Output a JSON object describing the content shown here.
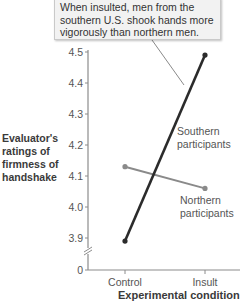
{
  "chart_data": {
    "type": "line",
    "title": "",
    "xlabel": "Experimental condition",
    "ylabel": [
      "Evaluator's",
      "ratings of",
      "firmness of",
      "handshake"
    ],
    "categories": [
      "Control",
      "Insult"
    ],
    "yticks": [
      "0",
      "3.9",
      "4.0",
      "4.1",
      "4.2",
      "4.3",
      "4.4",
      "4.5"
    ],
    "ylim": [
      3.9,
      4.5
    ],
    "axis_break": true,
    "grid": false,
    "series": [
      {
        "name": "Southern participants",
        "label_lines": [
          "Southern",
          "participants"
        ],
        "values": [
          3.89,
          4.49
        ],
        "color": "#2b2b2b"
      },
      {
        "name": "Northern participants",
        "label_lines": [
          "Northern",
          "participants"
        ],
        "values": [
          4.13,
          4.06
        ],
        "color": "#8a8a8a"
      }
    ],
    "annotation": {
      "lines": [
        "When insulted, men from the",
        "southern U.S. shook hands more",
        "vigorously than northern men."
      ],
      "points_to": "Southern participants"
    }
  }
}
